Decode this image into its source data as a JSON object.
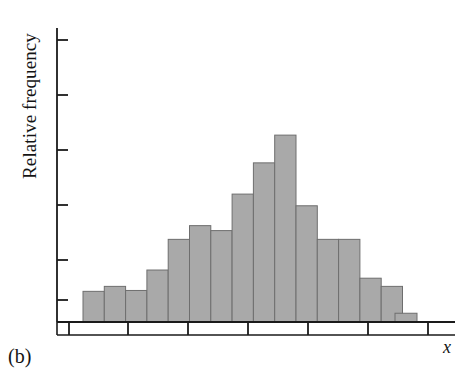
{
  "figure": {
    "panel_label": "(b)",
    "y_axis_label": "Relative frequency",
    "x_axis_label": "x"
  },
  "chart_data": {
    "type": "bar",
    "title": "",
    "subtitle": "",
    "xlabel": "x",
    "ylabel": "Relative frequency",
    "panel": "(b)",
    "grid": false,
    "legend": null,
    "axis": {
      "y_tick_count": 6,
      "y_tick_labels": [
        "",
        "",
        "",
        "",
        "",
        ""
      ],
      "y_ticks_labeled": false,
      "x_tick_count": 7,
      "x_tick_labels": [
        "",
        "",
        "",
        "",
        "",
        "",
        ""
      ],
      "x_ticks_labeled": false,
      "ylim": [
        0,
        1.0
      ],
      "xlim": [
        0,
        15.5
      ]
    },
    "bar_count": 16,
    "categories": [
      "1",
      "2",
      "3",
      "4",
      "5",
      "6",
      "7",
      "8",
      "9",
      "10",
      "11",
      "12",
      "13",
      "14",
      "15",
      "16"
    ],
    "values": [
      0.105,
      0.122,
      0.108,
      0.178,
      0.283,
      0.33,
      0.313,
      0.438,
      0.545,
      0.64,
      0.398,
      0.283,
      0.283,
      0.15,
      0.122,
      0.03
    ],
    "bar_color": "#a9a9a9",
    "bar_edge_color": "#6e6e6e",
    "axis_color": "#1a1a1a",
    "background_color": "#ffffff"
  },
  "geometry": {
    "plot_left": 57,
    "plot_baseline_y": 322,
    "plot_top_y": 30,
    "bar_origin_x": 83,
    "bar_width": 21.3,
    "outlier_bar_x": 395,
    "outlier_bar_width": 22,
    "ruler_y": 335,
    "ruler_left": 57,
    "ruler_right": 455,
    "y_tick_positions": [
      40,
      95,
      150,
      205,
      260,
      300
    ],
    "x_tick_positions": [
      69,
      128,
      188,
      248,
      308,
      368,
      428
    ]
  }
}
